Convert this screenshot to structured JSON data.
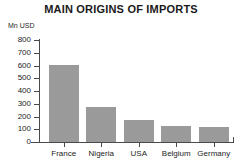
{
  "chart_data": {
    "type": "bar",
    "title": "MAIN ORIGINS OF IMPORTS",
    "xlabel": "",
    "ylabel": "Mn USD",
    "categories": [
      "France",
      "Nigeria",
      "USA",
      "Belgium",
      "Germany"
    ],
    "values": [
      605,
      275,
      170,
      125,
      115
    ],
    "ylim": [
      0,
      800
    ],
    "ytick_labels": [
      "800",
      "700",
      "600",
      "500",
      "400",
      "300",
      "200",
      "100",
      "0"
    ],
    "ytick_values": [
      800,
      700,
      600,
      500,
      400,
      300,
      200,
      100,
      0
    ],
    "grid": false,
    "legend": false,
    "bar_color": "#9a9a9a",
    "axis_color": "#4a4a4a",
    "text_color": "#1c1c1c",
    "background": "#ffffff"
  }
}
